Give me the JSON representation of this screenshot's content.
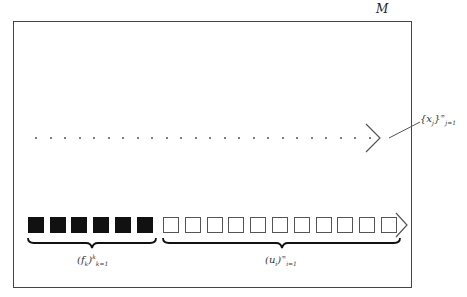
{
  "diagram": {
    "space_label": "M",
    "sequence_x": {
      "base": "{x",
      "index": "j",
      "close": "}",
      "sup": "∞",
      "sub": "j=1",
      "dot_count": 24
    },
    "sequence_f": {
      "base": "(f",
      "index": "k",
      "close": ")",
      "sup": "k",
      "sub": "k=1",
      "count": 6
    },
    "sequence_u": {
      "base": "(u",
      "index": "i",
      "close": ")",
      "sup": "∞",
      "sub": "i=1",
      "count": 11
    }
  }
}
